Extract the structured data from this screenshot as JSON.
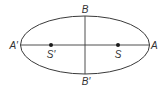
{
  "diagram": {
    "type": "ellipse-with-foci",
    "colors": {
      "stroke": "#3a3a3a",
      "label": "#333333",
      "focus_dot": "#1a1a1a",
      "background": "#ffffff"
    },
    "labels": {
      "right_vertex": "A",
      "left_vertex": "A′",
      "top_vertex": "B",
      "bottom_vertex": "B′",
      "right_focus": "S",
      "left_focus": "S′"
    }
  }
}
